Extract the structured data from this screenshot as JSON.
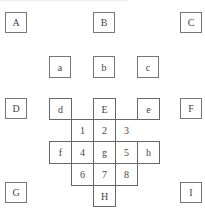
{
  "caption": "…………………………………………",
  "outer_boxes": {
    "A": "A",
    "B": "B",
    "C": "C",
    "D": "D",
    "F": "F",
    "G": "G",
    "I": "I"
  },
  "middle_boxes": {
    "a": "a",
    "b": "b",
    "c": "c",
    "d": "d",
    "E": "E",
    "e": "e"
  },
  "grid": {
    "row1": [
      "1",
      "2",
      "3"
    ],
    "row2": [
      "f",
      "4",
      "g",
      "5",
      "h"
    ],
    "row3": [
      "6",
      "7",
      "8"
    ],
    "bottom": "H"
  }
}
